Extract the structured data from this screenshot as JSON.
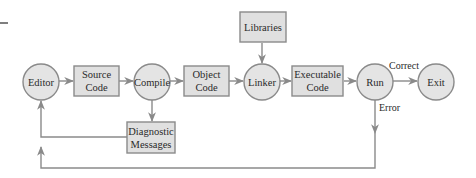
{
  "diagram": {
    "colors": {
      "node_fill": "#e4e4e4",
      "stroke": "#8a8a8a",
      "text": "#2a2a2a"
    },
    "nodes": {
      "editor": {
        "label": "Editor",
        "shape": "circle"
      },
      "source_code": {
        "line1": "Source",
        "line2": "Code",
        "shape": "box"
      },
      "compile": {
        "label": "Compile",
        "shape": "circle"
      },
      "diagnostic_messages": {
        "line1": "Diagnostic",
        "line2": "Messages",
        "shape": "box"
      },
      "object_code": {
        "line1": "Object",
        "line2": "Code",
        "shape": "box"
      },
      "libraries": {
        "label": "Libraries",
        "shape": "box"
      },
      "linker": {
        "label": "Linker",
        "shape": "circle"
      },
      "executable_code": {
        "line1": "Executable",
        "line2": "Code",
        "shape": "box"
      },
      "run": {
        "label": "Run",
        "shape": "circle"
      },
      "exit": {
        "label": "Exit",
        "shape": "circle"
      }
    },
    "edge_labels": {
      "correct": "Correct",
      "error": "Error"
    },
    "edges": [
      {
        "from": "Editor",
        "to": "Source Code"
      },
      {
        "from": "Source Code",
        "to": "Compile"
      },
      {
        "from": "Compile",
        "to": "Object Code"
      },
      {
        "from": "Compile",
        "to": "Diagnostic Messages"
      },
      {
        "from": "Diagnostic Messages",
        "to": "Editor"
      },
      {
        "from": "Object Code",
        "to": "Linker"
      },
      {
        "from": "Libraries",
        "to": "Linker"
      },
      {
        "from": "Linker",
        "to": "Executable Code"
      },
      {
        "from": "Executable Code",
        "to": "Run"
      },
      {
        "from": "Run",
        "to": "Exit",
        "label": "Correct"
      },
      {
        "from": "Run",
        "to": "Editor",
        "label": "Error"
      }
    ]
  }
}
